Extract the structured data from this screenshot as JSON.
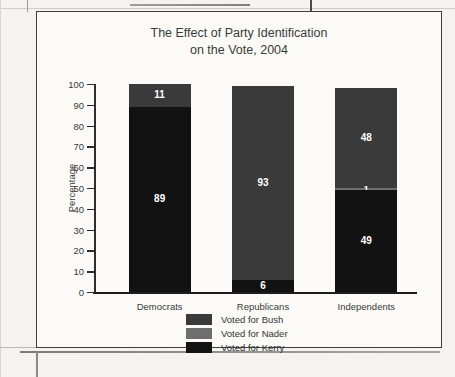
{
  "chart_data": {
    "type": "bar",
    "subtype": "stacked-column",
    "title": "The Effect of Party Identification on the Vote, 2004",
    "title_line1": "The Effect of Party Identification",
    "title_line2": "on the Vote, 2004",
    "xlabel": "",
    "ylabel": "Percentage",
    "ylim": [
      0,
      100
    ],
    "ytick_step": 10,
    "ytick_labels": [
      "100",
      "90",
      "80",
      "70",
      "60",
      "50",
      "40",
      "30",
      "20",
      "10",
      "0"
    ],
    "grid": false,
    "legend_position": "bottom-center",
    "categories": [
      "Democrats",
      "Republicans",
      "Independents"
    ],
    "stack_order_bottom_to_top": [
      "Voted for Kerry",
      "Voted for Nader",
      "Voted for Bush"
    ],
    "series": [
      {
        "name": "Voted for Bush",
        "color": "#3a3a3a",
        "values": [
          11,
          93,
          48
        ]
      },
      {
        "name": "Voted for Nader",
        "color": "#6e6e6e",
        "values": [
          0,
          0,
          1
        ]
      },
      {
        "name": "Voted for Kerry",
        "color": "#121212",
        "values": [
          89,
          6,
          49
        ]
      }
    ],
    "bars": [
      {
        "category": "Democrats",
        "segments": [
          {
            "series": "Voted for Kerry",
            "value": 89,
            "label": "89",
            "color": "#121212"
          },
          {
            "series": "Voted for Bush",
            "value": 11,
            "label": "11",
            "color": "#3a3a3a"
          }
        ]
      },
      {
        "category": "Republicans",
        "segments": [
          {
            "series": "Voted for Kerry",
            "value": 6,
            "label": "6",
            "color": "#121212"
          },
          {
            "series": "Voted for Bush",
            "value": 93,
            "label": "93",
            "color": "#3a3a3a"
          }
        ]
      },
      {
        "category": "Independents",
        "segments": [
          {
            "series": "Voted for Kerry",
            "value": 49,
            "label": "49",
            "color": "#121212"
          },
          {
            "series": "Voted for Nader",
            "value": 1,
            "label": "1",
            "color": "#6e6e6e"
          },
          {
            "series": "Voted for Bush",
            "value": 48,
            "label": "48",
            "color": "#3a3a3a"
          }
        ]
      }
    ]
  },
  "legend": {
    "items": [
      {
        "label": "Voted for Bush",
        "color": "#3a3a3a"
      },
      {
        "label": "Voted for Nader",
        "color": "#6e6e6e"
      },
      {
        "label": "Voted for Kerry",
        "color": "#121212"
      }
    ]
  }
}
